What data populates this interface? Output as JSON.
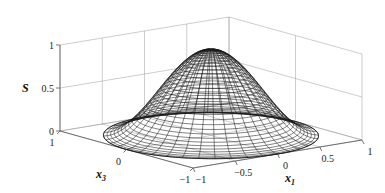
{
  "chart_data": {
    "type": "surface3d",
    "title": "",
    "function": "S(x1,x3) = cos^2(pi/2 * r) for r = sqrt(x1^2+x3^2) <= 1, else 0 (bell-shaped wireframe dome)",
    "axes": {
      "x1": {
        "label": "x",
        "subscript": "1",
        "range": [
          -1,
          1
        ],
        "ticks": [
          -1,
          -0.5,
          0,
          0.5,
          1
        ],
        "tick_labels": [
          "-1",
          "-0.5",
          "0",
          "0.5",
          "1"
        ]
      },
      "x3": {
        "label": "x",
        "subscript": "3",
        "range": [
          -1,
          1
        ],
        "ticks": [
          -1,
          0,
          1
        ],
        "tick_labels": [
          "-1",
          "0",
          "1"
        ]
      },
      "s": {
        "label": "S",
        "range": [
          0,
          1
        ],
        "ticks": [
          0,
          0.5,
          1
        ],
        "tick_labels": [
          "0",
          "0.5",
          "1"
        ]
      }
    },
    "peak": {
      "x1": 0,
      "x3": 0,
      "s": 1
    },
    "support_radius": 1,
    "grid": true,
    "box": true,
    "mesh": {
      "radial_lines": 40,
      "rings": 30
    },
    "legend": null
  },
  "labels": {
    "s_axis": "S",
    "x1_axis": "x",
    "x1_sub": "1",
    "x3_axis": "x",
    "x3_sub": "3"
  },
  "colors": {
    "mesh": "#1a1a1a",
    "grid": "#9a9a9a",
    "box": "#555555",
    "background": "#ffffff"
  }
}
